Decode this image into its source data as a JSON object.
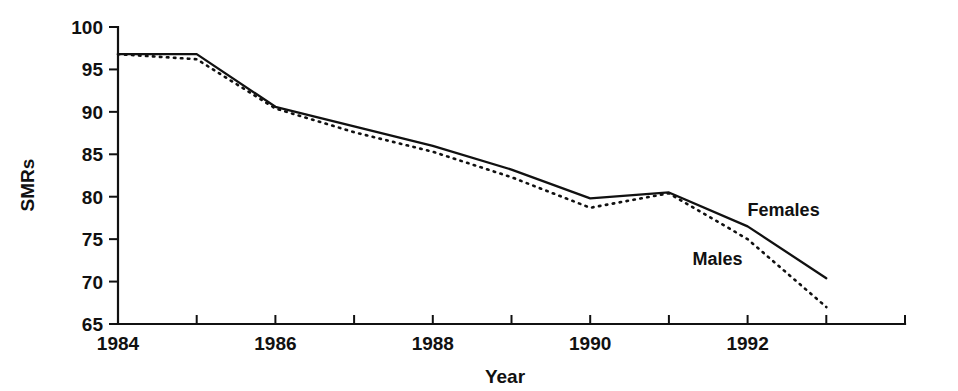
{
  "chart_data": {
    "type": "line",
    "title": "",
    "xlabel": "Year",
    "ylabel": "SMRs",
    "xlim": [
      1984,
      1994
    ],
    "ylim": [
      65,
      100
    ],
    "grid": false,
    "legend_position": "inline-right",
    "x": [
      1984,
      1985,
      1986,
      1987,
      1988,
      1989,
      1990,
      1991,
      1992,
      1993
    ],
    "x_tick_values": [
      1984,
      1985,
      1986,
      1987,
      1988,
      1989,
      1990,
      1991,
      1992,
      1993,
      1994
    ],
    "x_tick_labels": [
      "1984",
      "",
      "1986",
      "",
      "1988",
      "",
      "1990",
      "",
      "1992",
      "",
      ""
    ],
    "y_tick_values": [
      65,
      70,
      75,
      80,
      85,
      90,
      95,
      100
    ],
    "y_tick_labels": [
      "65",
      "70",
      "75",
      "80",
      "85",
      "90",
      "95",
      "100"
    ],
    "series": [
      {
        "name": "Females",
        "style": "solid",
        "color": "#111111",
        "values": [
          96.8,
          96.8,
          90.6,
          88.3,
          86.0,
          83.2,
          79.8,
          80.5,
          76.5,
          70.4
        ]
      },
      {
        "name": "Males",
        "style": "dotted",
        "color": "#111111",
        "values": [
          96.8,
          96.2,
          90.4,
          87.6,
          85.3,
          82.3,
          78.7,
          80.4,
          75.0,
          67.0
        ]
      }
    ],
    "annotations": [
      {
        "text": "Females",
        "x": 1992.0,
        "y": 77.7
      },
      {
        "text": "Males",
        "x": 1991.3,
        "y": 71.9
      }
    ]
  }
}
